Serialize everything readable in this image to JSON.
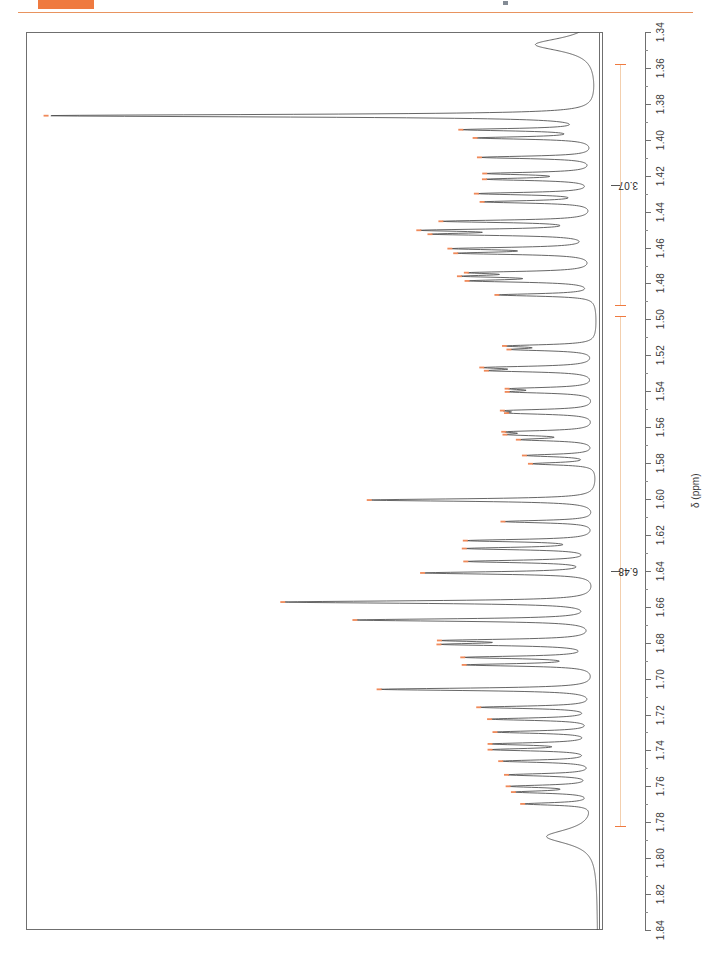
{
  "header": {
    "badge_name": "orange-highlight-block",
    "rule_name": "orange-horizontal-rule",
    "accent_color": "#ef7a40"
  },
  "axis": {
    "title": "δ (ppm)",
    "orientation": "vertical-right",
    "min": 1.34,
    "max": 1.84,
    "direction": "increasing-downward",
    "tick_labels": [
      "1.34",
      "1.36",
      "1.38",
      "1.40",
      "1.42",
      "1.44",
      "1.46",
      "1.48",
      "1.50",
      "1.52",
      "1.54",
      "1.56",
      "1.58",
      "1.60",
      "1.62",
      "1.64",
      "1.66",
      "1.68",
      "1.70",
      "1.72",
      "1.74",
      "1.76",
      "1.78",
      "1.80",
      "1.82",
      "1.84"
    ]
  },
  "integrals": [
    {
      "label": "3.07",
      "from_ppm": 1.358,
      "to_ppm": 1.492
    },
    {
      "label": "6.48",
      "from_ppm": 1.498,
      "to_ppm": 1.782
    }
  ],
  "peak_labels": [
    "693.3",
    "697.2",
    "699.5",
    "704.9",
    "709.4",
    "711.0",
    "715.0",
    "717.3",
    "722.7",
    "725.2",
    "726.3",
    "730.3",
    "731.6",
    "737.0",
    "738.0",
    "739.3",
    "743.2",
    "757.4",
    "758.4",
    "763.4",
    "764.3",
    "769.3",
    "770.2",
    "775.4",
    "776.1",
    "781.3",
    "782.1",
    "783.5",
    "787.9",
    "790.2",
    "800.3",
    "806.3",
    "811.6",
    "813.8",
    "817.4",
    "820.6",
    "828.7",
    "833.7",
    "839.4",
    "840.5",
    "844.1",
    "846.2",
    "853.0",
    "858.0",
    "861.3",
    "864.9",
    "868.2",
    "869.8",
    "873.0",
    "876.8",
    "880.0",
    "881.6",
    "884.9"
  ],
  "chart_data": {
    "type": "line",
    "title": "",
    "xlabel": "δ (ppm)",
    "ylabel": "",
    "xlim": [
      1.34,
      1.84
    ],
    "grid": false,
    "legend": null,
    "orientation": "rotated-90-axis-vertical",
    "series": [
      {
        "name": "1H NMR trace",
        "peaks_hz": [
          693.3,
          697.2,
          699.5,
          704.9,
          709.4,
          711.0,
          715.0,
          717.3,
          722.7,
          725.2,
          726.3,
          730.3,
          731.6,
          737.0,
          738.0,
          739.3,
          743.2,
          757.4,
          758.4,
          763.4,
          764.3,
          769.3,
          770.2,
          775.4,
          776.1,
          781.3,
          782.1,
          783.5,
          787.9,
          790.2,
          800.3,
          806.3,
          811.6,
          813.8,
          817.4,
          820.6,
          828.7,
          833.7,
          839.4,
          840.5,
          844.1,
          846.2,
          853.0,
          858.0,
          861.3,
          864.9,
          868.2,
          869.8,
          873.0,
          876.8,
          880.0,
          881.6,
          884.9
        ],
        "peaks_ppm": [
          1.3866,
          1.3944,
          1.399,
          1.4098,
          1.4188,
          1.422,
          1.43,
          1.4346,
          1.4454,
          1.4504,
          1.4526,
          1.4606,
          1.4632,
          1.474,
          1.476,
          1.4786,
          1.4864,
          1.5148,
          1.5168,
          1.5268,
          1.5286,
          1.5386,
          1.5404,
          1.5508,
          1.5522,
          1.5626,
          1.5642,
          1.567,
          1.5758,
          1.5804,
          1.6006,
          1.6126,
          1.6232,
          1.6276,
          1.6348,
          1.6412,
          1.6574,
          1.6674,
          1.6788,
          1.681,
          1.6882,
          1.6924,
          1.706,
          1.716,
          1.7226,
          1.7298,
          1.7364,
          1.7396,
          1.746,
          1.7536,
          1.76,
          1.7632,
          1.7698
        ],
        "intensities": [
          0.97,
          0.22,
          0.2,
          0.2,
          0.18,
          0.18,
          0.2,
          0.19,
          0.26,
          0.27,
          0.25,
          0.23,
          0.22,
          0.19,
          0.19,
          0.2,
          0.17,
          0.14,
          0.13,
          0.17,
          0.16,
          0.13,
          0.13,
          0.13,
          0.12,
          0.13,
          0.12,
          0.12,
          0.12,
          0.11,
          0.4,
          0.16,
          0.22,
          0.22,
          0.22,
          0.3,
          0.55,
          0.42,
          0.24,
          0.24,
          0.22,
          0.22,
          0.38,
          0.2,
          0.18,
          0.17,
          0.17,
          0.17,
          0.16,
          0.15,
          0.14,
          0.13,
          0.12
        ]
      }
    ]
  }
}
